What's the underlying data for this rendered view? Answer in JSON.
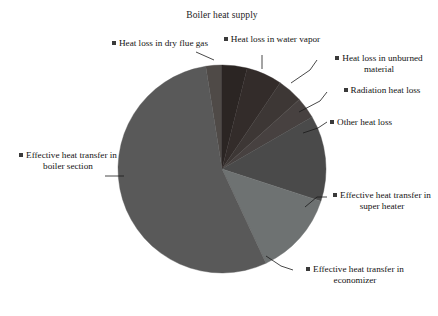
{
  "chart_data": {
    "type": "pie",
    "title": "Boiler heat supply",
    "legend_position": "callout-labels",
    "grid": false,
    "categories": [
      "Heat loss in dry flue gas",
      "Heat loss in water vapor",
      "Heat loss in unburned material",
      "Radiation heat loss",
      "Other heat loss",
      "Effective heat transfer in super heater",
      "Effective heat transfer in economizer",
      "Effective heat transfer in boiler section"
    ],
    "values": [
      2.5,
      3.9,
      5.6,
      3.9,
      3.3,
      13.3,
      13.1,
      54.4
    ],
    "units": "percent",
    "colors": [
      "#4f4a47",
      "#2b2523",
      "#332c2a",
      "#3d3735",
      "#474140",
      "#4a4a4a",
      "#6e7272",
      "#595959"
    ],
    "slices": [
      {
        "label": "Heat loss in dry flue gas",
        "percent": 2.5,
        "start_deg": 351.0,
        "end_deg": 360.0,
        "color": "#4f4a47"
      },
      {
        "label": "Heat loss in water vapor",
        "percent": 3.9,
        "start_deg": 0.0,
        "end_deg": 14.0,
        "color": "#2b2523"
      },
      {
        "label": "Heat loss in unburned material",
        "percent": 5.6,
        "start_deg": 14.0,
        "end_deg": 34.0,
        "color": "#332c2a"
      },
      {
        "label": "Radiation heat loss",
        "percent": 3.9,
        "start_deg": 34.0,
        "end_deg": 48.0,
        "color": "#3d3735"
      },
      {
        "label": "Other heat loss",
        "percent": 3.3,
        "start_deg": 48.0,
        "end_deg": 60.0,
        "color": "#474140"
      },
      {
        "label": "Effective heat transfer in super heater",
        "percent": 13.3,
        "start_deg": 60.0,
        "end_deg": 108.0,
        "color": "#4a4a4a"
      },
      {
        "label": "Effective heat transfer in economizer",
        "percent": 13.1,
        "start_deg": 108.0,
        "end_deg": 155.0,
        "color": "#6e7272"
      },
      {
        "label": "Effective heat transfer in boiler section",
        "percent": 54.4,
        "start_deg": 155.0,
        "end_deg": 351.0,
        "color": "#595959"
      }
    ],
    "center": {
      "x": 222,
      "y": 169
    },
    "radius": 104
  },
  "labels": {
    "dry_flue_gas": "Heat loss in dry flue gas",
    "water_vapor": "Heat loss in water vapor",
    "unburned": "Heat loss in unburned material",
    "radiation": "Radiation heat loss",
    "other": "Other heat loss",
    "super_heater": "Effective heat transfer in super heater",
    "economizer": "Effective heat transfer in economizer",
    "boiler_section": "Effective heat transfer in boiler section"
  }
}
